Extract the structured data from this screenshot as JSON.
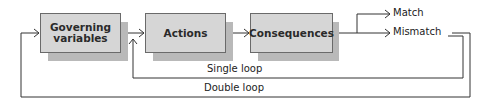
{
  "diagram": {
    "nodes": [
      {
        "id": "governing",
        "label": "Governing\nvariables",
        "line1": "Governing",
        "line2": "variables"
      },
      {
        "id": "actions",
        "label": "Actions"
      },
      {
        "id": "consequences",
        "label": "Consequences"
      }
    ],
    "outcomes": {
      "match": "Match",
      "mismatch": "Mismatch"
    },
    "loops": {
      "single": "Single loop",
      "double": "Double loop"
    },
    "edges": [
      {
        "from": "governing",
        "to": "actions"
      },
      {
        "from": "actions",
        "to": "consequences"
      },
      {
        "from": "consequences",
        "to": "match"
      },
      {
        "from": "consequences",
        "to": "mismatch"
      },
      {
        "from": "mismatch",
        "to": "actions",
        "label": "Single loop"
      },
      {
        "from": "mismatch",
        "to": "governing",
        "label": "Double loop"
      }
    ],
    "colors": {
      "box_fill": "#d6d6d6",
      "box_shadow": "#b9b9b9",
      "box_border": "#6a6a6a",
      "line": "#333333"
    }
  }
}
